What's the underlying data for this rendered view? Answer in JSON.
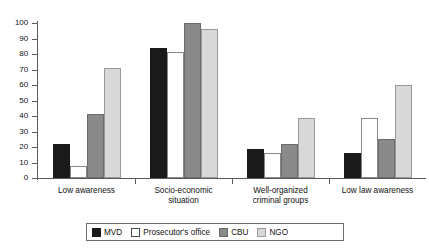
{
  "chart_data": {
    "type": "bar",
    "title": "",
    "subtitle": "",
    "xlabel": "",
    "ylabel": "",
    "ylim": [
      0,
      100
    ],
    "ytick_step": 10,
    "yticks": [
      0,
      10,
      20,
      30,
      40,
      50,
      60,
      70,
      80,
      90,
      100
    ],
    "grid": false,
    "legend_position": "bottom",
    "categories": [
      "Low awareness",
      "Socio-economic situation",
      "Well-organized criminal groups",
      "Low law awareness"
    ],
    "category_lines": [
      [
        "Low awareness"
      ],
      [
        "Socio-economic",
        "situation"
      ],
      [
        "Well-organized",
        "criminal groups"
      ],
      [
        "Low law awareness"
      ]
    ],
    "series": [
      {
        "name": "MVD",
        "color": "#1a1a1a",
        "values": [
          22,
          84,
          19,
          16
        ]
      },
      {
        "name": "Prosecutor's office",
        "color": "#ffffff",
        "values": [
          8,
          81,
          16,
          39
        ]
      },
      {
        "name": "CBU",
        "color": "#8a8a8a",
        "values": [
          41,
          100,
          22,
          25
        ]
      },
      {
        "name": "NGO",
        "color": "#d8d8d8",
        "values": [
          71,
          96,
          39,
          60
        ]
      }
    ]
  }
}
